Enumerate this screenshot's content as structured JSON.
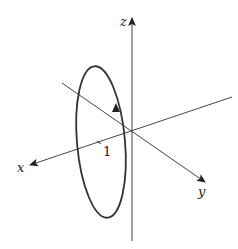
{
  "diagram": {
    "type": "3d-axes-with-circle",
    "axes": {
      "x": {
        "label": "x"
      },
      "y": {
        "label": "y"
      },
      "z": {
        "label": "z"
      }
    },
    "tick": {
      "label": "1"
    },
    "curve": {
      "shape": "circle",
      "orientation": "counterclockwise-arrow-upward"
    },
    "colors": {
      "stroke": "#333333",
      "background": "#ffffff"
    }
  }
}
